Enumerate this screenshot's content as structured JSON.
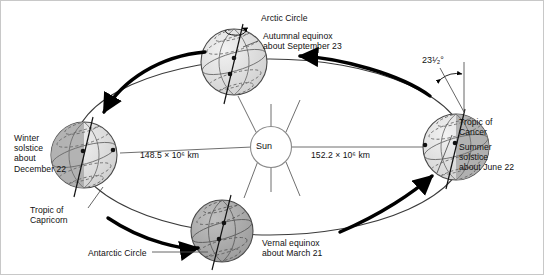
{
  "diagram": {
    "background_color": "#ffffff",
    "border_color": "#c8c8c8"
  },
  "sun": {
    "label": "Sun",
    "fill": "#ffffff",
    "stroke": "#8a8a8a"
  },
  "distances": {
    "left": "148.5 × 10⁶ km",
    "right": "152.2 × 10⁶ km"
  },
  "tilt": {
    "angle_label": "23¹⁄₂°"
  },
  "positions": [
    {
      "id": "winter-solstice",
      "name": "Winter solstice",
      "label": "Winter\nsolstice\nabout\nDecember 22",
      "feature_label": "Tropic of\nCapricorn",
      "lit_side": "right"
    },
    {
      "id": "autumnal-equinox",
      "name": "Autumnal equinox",
      "label": "Autumnal equinox\nabout September 23",
      "feature_label": "Arctic Circle",
      "lit_side": "front"
    },
    {
      "id": "summer-solstice",
      "name": "Summer solstice",
      "label": "Summer\nsolstice\nabout June 22",
      "feature_label": "Tropic of\nCancer",
      "lit_side": "left"
    },
    {
      "id": "vernal-equinox",
      "name": "Vernal equinox",
      "label": "Vernal equinox\nabout March 21",
      "feature_label": "Antarctic Circle",
      "lit_side": "back"
    }
  ],
  "colors": {
    "globe_light": "#e2e2e2",
    "globe_dark": "#a9a9a9",
    "globe_stroke": "#4a4a4a",
    "orbit_stroke": "#2b2b2b",
    "arrow": "#000000",
    "leader": "#555555"
  }
}
